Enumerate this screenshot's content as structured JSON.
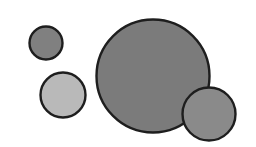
{
  "canvas": {
    "width": 256,
    "height": 147,
    "background": "#ffffff"
  },
  "stroke": {
    "color": "#1e1e1e",
    "width": 2.4
  },
  "circles": [
    {
      "id": "small-top-left",
      "cx": 46,
      "cy": 43,
      "r": 16.5,
      "fill": "#808080"
    },
    {
      "id": "light-left",
      "cx": 63,
      "cy": 95,
      "r": 22.5,
      "fill": "#b9b9b9"
    },
    {
      "id": "large-center",
      "cx": 153,
      "cy": 76,
      "r": 56.5,
      "fill": "#7b7b7b"
    },
    {
      "id": "medium-bottom-right",
      "cx": 209,
      "cy": 114,
      "r": 26.5,
      "fill": "#8a8a8a"
    }
  ]
}
